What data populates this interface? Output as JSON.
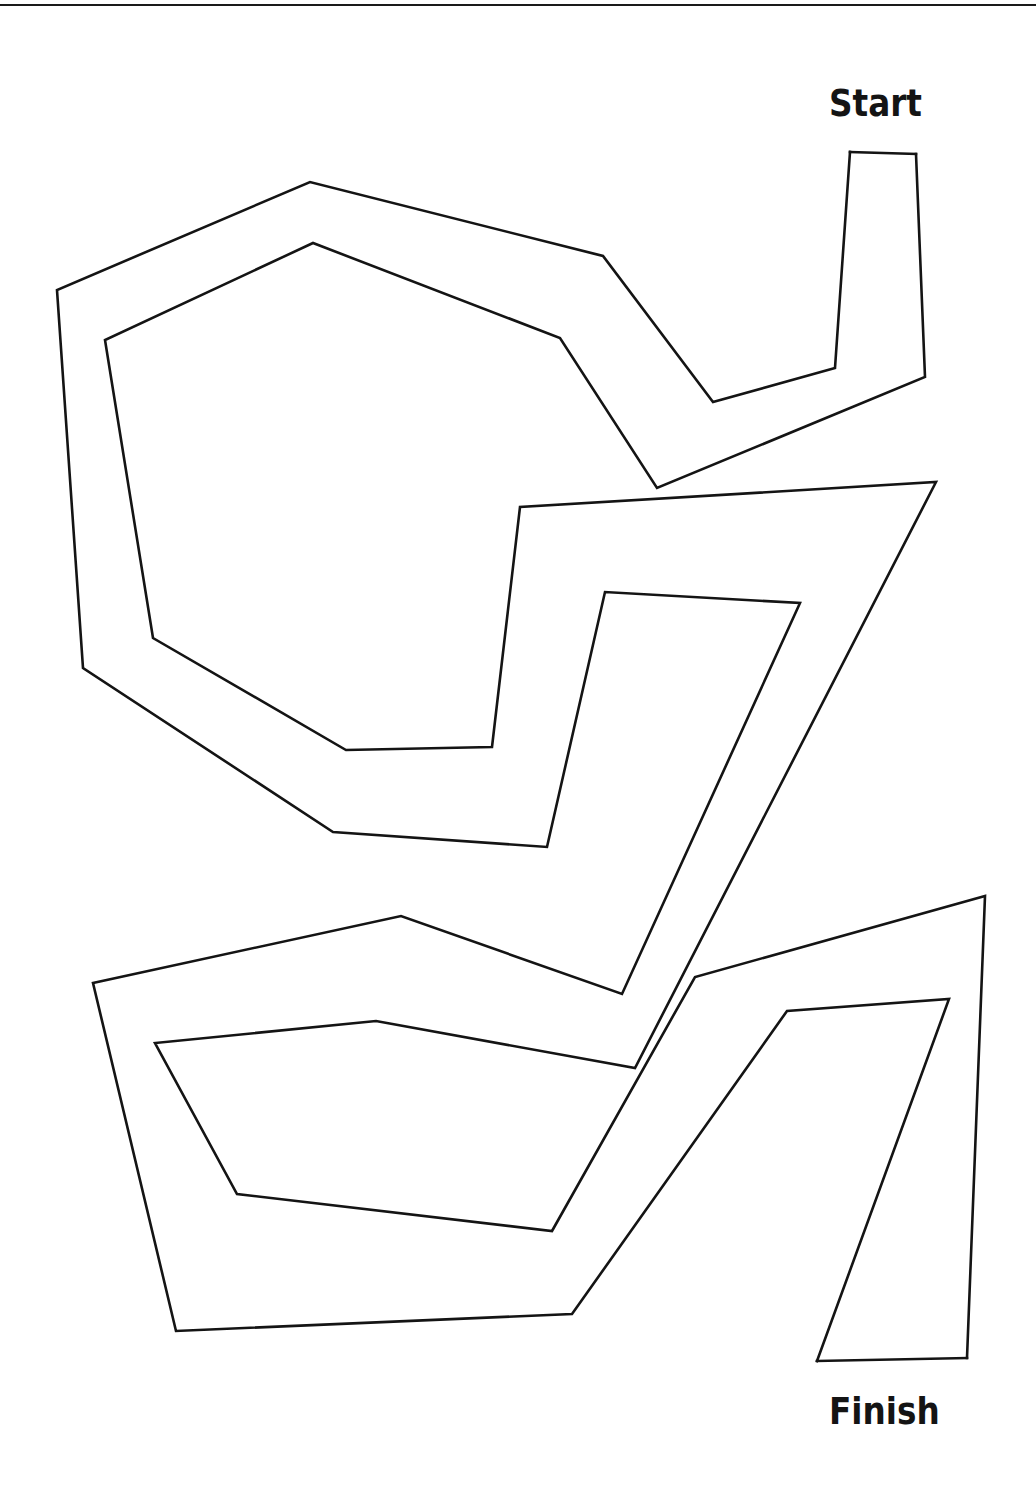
{
  "diagram": {
    "type": "maze",
    "labels": {
      "start": "Start",
      "finish": "Finish"
    },
    "style": {
      "stroke_color": "#141414",
      "stroke_width": 2.6,
      "background": "#ffffff"
    },
    "walls": {
      "wall_a": "916,154 925,377 657,488 560,338 313,243 105,340 153,638 346,750 492,747 520,507 936,482 635,1068 376,1021 155,1043 237,1194 552,1231 695,977 985,896 967,1358",
      "wall_b": "850,152 835,368 713,402 603,256 310,182 57,290 83,668 333,832 547,847 605,592 800,603 622,994 401,916 93,983 176,1331 572,1314 787,1011 949,999 817,1361",
      "start_cap": "850,152 916,154",
      "finish_cap": "817,1361 967,1358"
    }
  }
}
